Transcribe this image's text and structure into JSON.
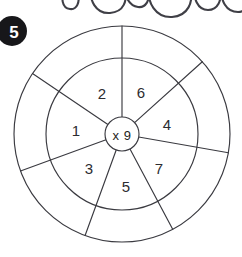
{
  "page": {
    "width": 242,
    "height": 257,
    "background_color": "#ffffff",
    "ink_color": "#3a3a40"
  },
  "badge": {
    "label": "5",
    "shape": "filled-circle",
    "fill_color": "#17171a",
    "text_color": "#ffffff",
    "cx": 14,
    "cy": 31,
    "r": 15,
    "clipped_at_left_edge": true
  },
  "handwriting": {
    "present": true,
    "description": "partial cursive loops cut off at top edge",
    "stroke_color": "#3f3f46"
  },
  "wheel": {
    "center_x": 122,
    "center_y": 134,
    "inner_radius": 17,
    "middle_radius": 76,
    "outer_radius": 108,
    "center_label": "x 9",
    "operation": "multiply",
    "multiplier": "9",
    "spoke_count": 7,
    "spoke_angles_deg": [
      270,
      318,
      10,
      62,
      110,
      160,
      214
    ],
    "sectors": [
      {
        "label": "1",
        "angle_deg": 185,
        "label_radius": 46
      },
      {
        "label": "2",
        "angle_deg": 244,
        "label_radius": 46
      },
      {
        "label": "6",
        "angle_deg": 294,
        "label_radius": 46
      },
      {
        "label": "4",
        "angle_deg": 341,
        "label_radius": 46
      },
      {
        "label": "7",
        "angle_deg": 37,
        "label_radius": 46
      },
      {
        "label": "5",
        "angle_deg": 80,
        "label_radius": 46
      },
      {
        "label": "3",
        "angle_deg": 133,
        "label_radius": 46
      }
    ]
  }
}
